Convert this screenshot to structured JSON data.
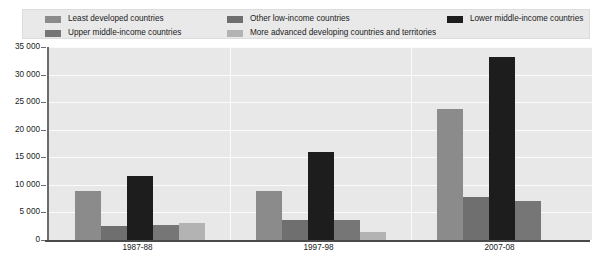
{
  "chart_data": {
    "type": "bar",
    "title": "",
    "xlabel": "",
    "ylabel": "",
    "categories": [
      "1987-88",
      "1997-98",
      "2007-08"
    ],
    "ylim": [
      0,
      35000
    ],
    "yticks": [
      0,
      5000,
      10000,
      15000,
      20000,
      25000,
      30000,
      35000
    ],
    "ytick_labels": [
      "0",
      "5 000",
      "10 000",
      "15 000",
      "20 000",
      "25 000",
      "30 000",
      "35 000"
    ],
    "grid": true,
    "legend_position": "top",
    "series": [
      {
        "name": "Least developed countries",
        "color": "#8b8b8b",
        "values": [
          8800,
          8800,
          23700
        ]
      },
      {
        "name": "Other low-income countries",
        "color": "#6f6f6f",
        "values": [
          2600,
          3600,
          7800
        ]
      },
      {
        "name": "Lower middle-income countries",
        "color": "#1d1d1d",
        "values": [
          11600,
          16000,
          33100
        ]
      },
      {
        "name": "Upper middle-income countries",
        "color": "#767676",
        "values": [
          2800,
          3600,
          7100
        ]
      },
      {
        "name": "More advanced developing countries and territories",
        "color": "#b3b3b3",
        "values": [
          3000,
          1500,
          0
        ]
      }
    ]
  },
  "legend": {
    "columns": [
      [
        {
          "label": "Least developed countries",
          "color": "#8b8b8b"
        },
        {
          "label": "Upper middle-income countries",
          "color": "#767676"
        }
      ],
      [
        {
          "label": "Other low-income countries",
          "color": "#6f6f6f"
        },
        {
          "label": "More advanced developing countries and territories",
          "color": "#b3b3b3"
        }
      ],
      [
        {
          "label": "Lower middle-income countries",
          "color": "#1d1d1d"
        }
      ]
    ]
  }
}
